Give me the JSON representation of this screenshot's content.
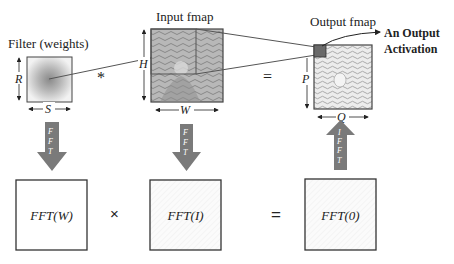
{
  "top_row": {
    "filter": {
      "title": "Filter (weights)",
      "height_label": "R",
      "width_label": "S"
    },
    "conv_operator": "*",
    "input": {
      "title": "Input fmap",
      "height_label": "H",
      "width_label": "W"
    },
    "equals_operator": "=",
    "output": {
      "title": "Output fmap",
      "height_label": "P",
      "width_label": "Q",
      "callout_line1": "An Output",
      "callout_line2": "Activation"
    }
  },
  "arrows": {
    "filter_down": [
      "F",
      "F",
      "T"
    ],
    "input_down": [
      "F",
      "F",
      "T"
    ],
    "output_up": [
      "I",
      "F",
      "F",
      "T"
    ]
  },
  "bottom_row": {
    "fft_w": "FFT(W)",
    "multiply_operator": "×",
    "fft_i": "FFT(I)",
    "equals_operator": "=",
    "fft_o": "FFT(0)"
  },
  "colors": {
    "arrow_fill": "#7a7a7a",
    "box_stroke": "#333333",
    "highlight_square": "#6a6a6a",
    "line": "#555555"
  }
}
